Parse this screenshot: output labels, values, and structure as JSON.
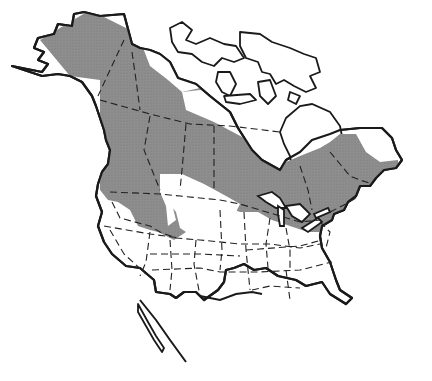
{
  "map": {
    "title": "",
    "description": "Range map of North America",
    "region": "North America",
    "legend": [],
    "colors": {
      "range_fill": "#8c8c8c",
      "land": "#ffffff",
      "coastline": "#1a1a1a",
      "borders": "#222222",
      "background": "#ffffff"
    },
    "shaded_range": {
      "label": "species range",
      "extent": "Alaska, northern and central Canada, northern Rocky Mountains, Great Lakes, New England"
    }
  }
}
